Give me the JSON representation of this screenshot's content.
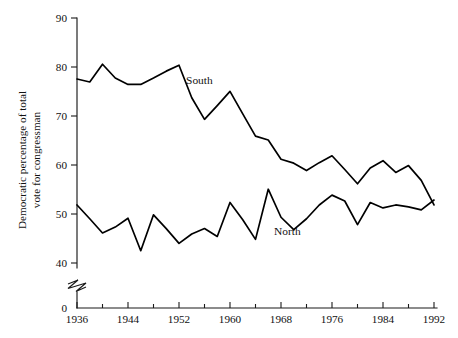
{
  "chart_data": {
    "type": "line",
    "title": "",
    "xlabel": "",
    "ylabel": "Democratic percentage of total vote for congressman",
    "ylabel_line1": "Democratic percentage of total",
    "ylabel_line2": "vote for congressman",
    "xlim": [
      1936,
      1992
    ],
    "ylim": [
      38,
      90
    ],
    "yaxis_has_break": true,
    "yaxis_break_note": "axis broken between 40 and 0",
    "grid": false,
    "legend": "inline-labels",
    "y_ticks": [
      40,
      50,
      60,
      70,
      80,
      90
    ],
    "y_tick_labels": [
      "40",
      "50",
      "60",
      "70",
      "80",
      "90"
    ],
    "y_zero_label": "0",
    "x_ticks_major": [
      1936,
      1944,
      1952,
      1960,
      1968,
      1976,
      1984,
      1992
    ],
    "x_tick_labels": [
      "1936",
      "1944",
      "1952",
      "1960",
      "1968",
      "1976",
      "1984",
      "1992"
    ],
    "x_ticks_minor": [
      1940,
      1948,
      1956,
      1964,
      1972,
      1980,
      1988
    ],
    "x": [
      1936,
      1938,
      1940,
      1942,
      1944,
      1946,
      1948,
      1950,
      1952,
      1954,
      1956,
      1958,
      1960,
      1962,
      1964,
      1966,
      1968,
      1970,
      1972,
      1974,
      1976,
      1978,
      1980,
      1982,
      1984,
      1986,
      1988,
      1990,
      1992
    ],
    "series": [
      {
        "name": "South",
        "label": "South",
        "label_x": 1955.2,
        "label_y": 76.6,
        "values": [
          77.6,
          77.0,
          80.6,
          77.8,
          76.5,
          76.5,
          77.8,
          79.2,
          80.4,
          73.8,
          69.4,
          72.2,
          75.1,
          70.5,
          66.0,
          65.2,
          61.3,
          60.5,
          59.0,
          60.6,
          62.0,
          59.2,
          56.3,
          59.5,
          61.0,
          58.6,
          60.0,
          57.0,
          52.0
        ]
      },
      {
        "name": "North",
        "label": "North",
        "label_x": 1969.0,
        "label_y": 45.8,
        "values": [
          52.0,
          49.2,
          46.3,
          47.5,
          49.3,
          42.7,
          50.0,
          47.2,
          44.2,
          46.1,
          47.2,
          45.6,
          52.5,
          49.0,
          45.0,
          55.2,
          49.5,
          47.0,
          49.2,
          52.0,
          54.0,
          52.8,
          48.0,
          52.5,
          51.4,
          52.0,
          51.6,
          51.0,
          53.0
        ]
      }
    ]
  },
  "geometry": {
    "plot_left_px": 77,
    "plot_right_px": 434,
    "y_top_value_px": 18,
    "y_bottom_value_px": 264,
    "zero_axis_px": 308
  }
}
